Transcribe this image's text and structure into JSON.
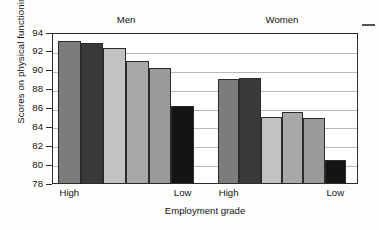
{
  "chart_data": {
    "type": "bar",
    "title": "",
    "xlabel": "Employment grade",
    "ylabel": "Scores on physical functioning",
    "ylim": [
      78,
      94
    ],
    "ytick_step": 2,
    "yticks": [
      94,
      92,
      90,
      88,
      86,
      84,
      82,
      80,
      78
    ],
    "grid": true,
    "legend": "none",
    "panels": [
      {
        "name": "Men",
        "x_anchor_labels": [
          "High",
          "Low"
        ],
        "categories": [
          "1",
          "2",
          "3",
          "4",
          "5",
          "6"
        ],
        "values": [
          93.2,
          92.9,
          92.4,
          91.0,
          90.3,
          86.3
        ],
        "colors": [
          "#7c7c7c",
          "#3a3a3a",
          "#c2c2c2",
          "#a8a8a8",
          "#9a9a9a",
          "#141414"
        ]
      },
      {
        "name": "Women",
        "x_anchor_labels": [
          "High",
          "Low"
        ],
        "categories": [
          "1",
          "2",
          "3",
          "4",
          "5",
          "6"
        ],
        "values": [
          89.1,
          89.25,
          85.1,
          85.65,
          85.0,
          80.55
        ],
        "colors": [
          "#7c7c7c",
          "#3a3a3a",
          "#c2c2c2",
          "#a8a8a8",
          "#9a9a9a",
          "#141414"
        ]
      }
    ]
  },
  "axis": {
    "y_title": "Scores on physical functioning",
    "x_title": "Employment grade",
    "tick_labels": [
      "94",
      "92",
      "90",
      "88",
      "86",
      "84",
      "82",
      "80",
      "78"
    ]
  },
  "panel_titles": {
    "men": "Men",
    "women": "Women"
  },
  "x_anchors": {
    "men_high": "High",
    "men_low": "Low",
    "women_high": "High",
    "women_low": "Low"
  }
}
